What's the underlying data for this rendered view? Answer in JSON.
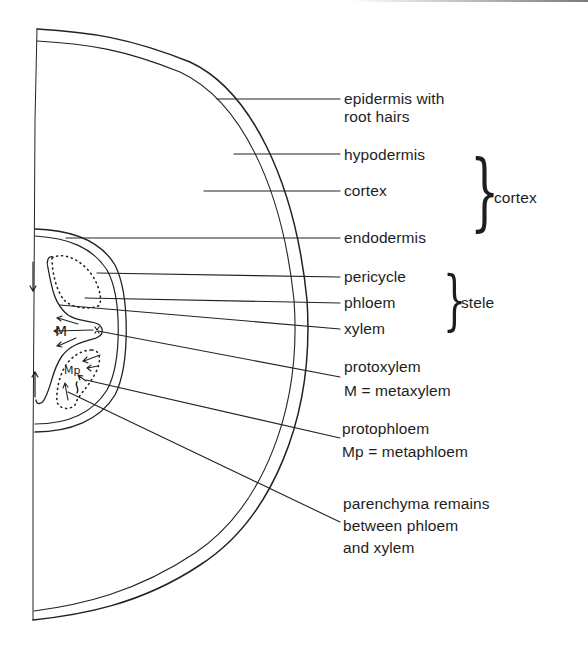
{
  "diagram": {
    "labels": {
      "epidermis": [
        "epidermis with",
        "root hairs"
      ],
      "hypodermis": "hypodermis",
      "cortex_inner": "cortex",
      "endodermis": "endodermis",
      "pericycle": "pericycle",
      "phloem": "phloem",
      "xylem": "xylem",
      "protoxylem": [
        "protoxylem",
        "M = metaxylem"
      ],
      "protophloem": [
        "protophloem",
        "Mp = metaphloem"
      ],
      "parenchyma": [
        "parenchyma remains",
        "between phloem",
        "and xylem"
      ]
    },
    "groups": {
      "cortex_group": "cortex",
      "stele_group": "stele"
    },
    "inner_marks": {
      "metaxylem": "M",
      "metaphloem": "Mp"
    },
    "colors": {
      "ink": "#1e1e1e",
      "background": "#ffffff"
    }
  }
}
